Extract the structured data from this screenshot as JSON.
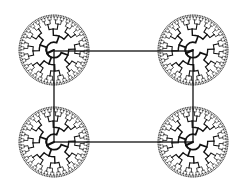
{
  "diagram": {
    "type": "four radial trees connected by a rectangle",
    "background": "#ffffff",
    "stroke_color": "#111111",
    "connector": {
      "shape": "rectangle",
      "corners": [
        [
          54,
          51
        ],
        [
          193,
          51
        ],
        [
          193,
          142
        ],
        [
          54,
          142
        ]
      ]
    },
    "trees": [
      {
        "id": "top-left",
        "cx": 54,
        "cy": 50,
        "r": 35,
        "rotation": 0
      },
      {
        "id": "top-right",
        "cx": 193,
        "cy": 50,
        "r": 35,
        "rotation": 0
      },
      {
        "id": "bottom-left",
        "cx": 54,
        "cy": 142,
        "r": 35,
        "rotation": 0
      },
      {
        "id": "bottom-right",
        "cx": 193,
        "cy": 142,
        "r": 35,
        "rotation": 0
      }
    ],
    "branch_depth": 6
  }
}
